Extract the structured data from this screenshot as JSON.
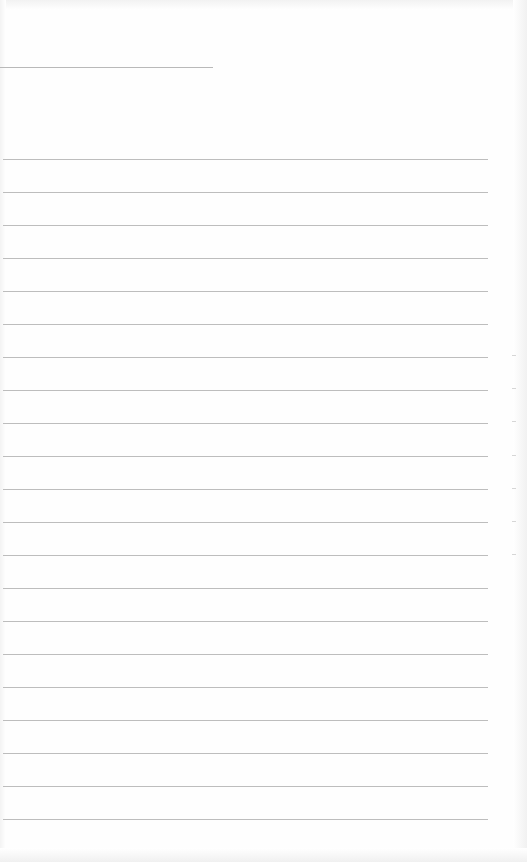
{
  "document": {
    "type": "lined-paper",
    "title_line_text": "",
    "ruled_line_count": 21,
    "lines": [
      "",
      "",
      "",
      "",
      "",
      "",
      "",
      "",
      "",
      "",
      "",
      "",
      "",
      "",
      "",
      "",
      "",
      "",
      "",
      "",
      ""
    ]
  }
}
